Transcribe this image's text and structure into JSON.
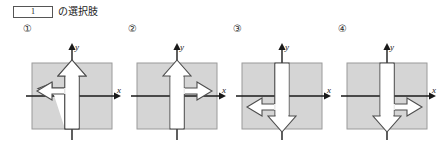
{
  "header": {
    "blank_number": "1",
    "label": "の選択肢"
  },
  "colors": {
    "square_fill": "#d5d5d5",
    "square_stroke": "#9a9a9a",
    "axis_stroke": "#1a1a1a",
    "arrow_fill": "#ffffff",
    "arrow_stroke": "#4d4d4d",
    "text": "#1a1a1a"
  },
  "axes": {
    "x_label": "x",
    "y_label": "y"
  },
  "options": [
    {
      "marker": "①",
      "vertical_arrow_direction": "up",
      "branch_direction": "left",
      "branch_side": "above-x-axis"
    },
    {
      "marker": "②",
      "vertical_arrow_direction": "up",
      "branch_direction": "right",
      "branch_side": "above-x-axis"
    },
    {
      "marker": "③",
      "vertical_arrow_direction": "down",
      "branch_direction": "left",
      "branch_side": "below-x-axis"
    },
    {
      "marker": "④",
      "vertical_arrow_direction": "down",
      "branch_direction": "right",
      "branch_side": "below-x-axis"
    }
  ]
}
